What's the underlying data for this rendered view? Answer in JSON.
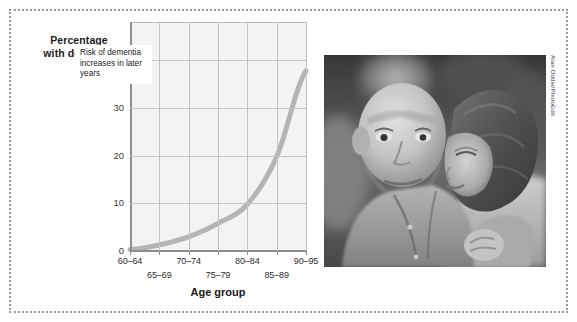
{
  "figure": {
    "photo_credit": "Alan Oddie/PhotoEdit",
    "border_color": "#9a9a9a",
    "plot_bg_color": "#f3f3f3",
    "curve_color": "#b4b4b4"
  },
  "chart_data": {
    "type": "line",
    "title": "",
    "xlabel": "Age group",
    "ylabel": "Percentage with dementia",
    "categories": [
      "60–64",
      "65–69",
      "70–74",
      "75–79",
      "80–84",
      "85–89",
      "90–95"
    ],
    "values": [
      0.5,
      1.5,
      3.2,
      6.0,
      10.0,
      20.0,
      38.0
    ],
    "yticks": [
      "0",
      "10",
      "20",
      "30",
      "40%"
    ],
    "ytick_values": [
      0,
      10,
      20,
      30,
      40
    ],
    "ylim": [
      0,
      48
    ],
    "grid": true,
    "legend": "none",
    "annotations": [
      {
        "text": "Risk of dementia increases in later years",
        "at_category": "75–79"
      }
    ]
  },
  "photo": {
    "alt": "Elderly man being kissed on the cheek by a younger woman, black and white photograph"
  }
}
